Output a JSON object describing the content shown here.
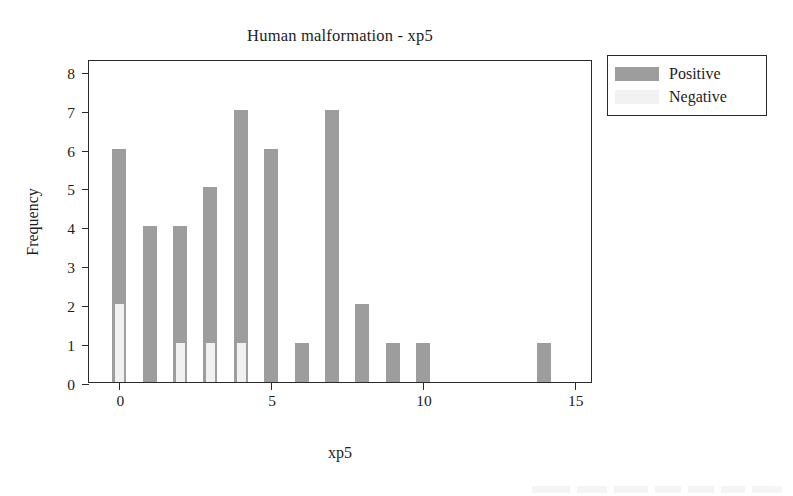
{
  "chart_data": {
    "type": "bar",
    "title": "Human malformation - xp5",
    "xlabel": "xp5",
    "ylabel": "Frequency",
    "grid": false,
    "legend_position": "right-top",
    "xlim": [
      -1,
      15.6
    ],
    "ylim": [
      0,
      8.3
    ],
    "xticks": [
      0,
      5,
      10,
      15
    ],
    "yticks": [
      0,
      1,
      2,
      3,
      4,
      5,
      6,
      7,
      8
    ],
    "categories": [
      0,
      1,
      2,
      3,
      4,
      5,
      6,
      7,
      8,
      9,
      10,
      14
    ],
    "series": [
      {
        "name": "Positive",
        "color": "#9d9d9d",
        "values": [
          6,
          4,
          4,
          5,
          7,
          6,
          1,
          7,
          2,
          1,
          1,
          1
        ]
      },
      {
        "name": "Negative",
        "color": "#f1f1f1",
        "values": [
          2,
          0,
          1,
          1,
          1,
          0,
          0,
          0,
          0,
          0,
          0,
          0
        ]
      }
    ]
  },
  "legend": {
    "entries": [
      {
        "label": "Positive",
        "swatch": "positive"
      },
      {
        "label": "Negative",
        "swatch": "negative"
      }
    ]
  }
}
